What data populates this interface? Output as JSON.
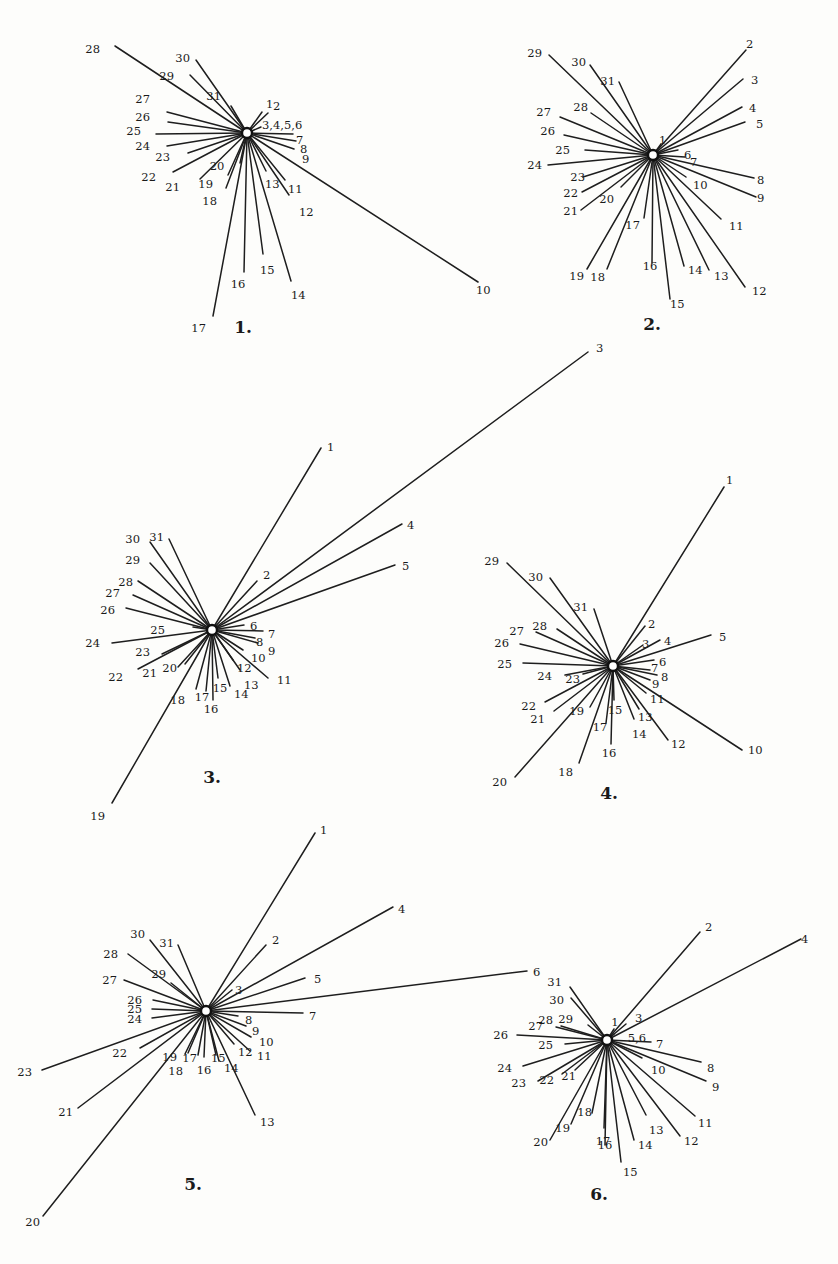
{
  "figure": {
    "panels": [
      {
        "caption": "1.",
        "rays": [
          "1",
          "2",
          "3,4,5,6",
          "7",
          "8",
          "9",
          "10",
          "11",
          "12",
          "13",
          "14",
          "15",
          "16",
          "17",
          "18",
          "19",
          "20",
          "21",
          "22",
          "23",
          "24",
          "25",
          "26",
          "27",
          "28",
          "29",
          "30",
          "31"
        ]
      },
      {
        "caption": "2.",
        "rays": [
          "1",
          "2",
          "3",
          "4",
          "5",
          "6",
          "7",
          "8",
          "9",
          "10",
          "11",
          "12",
          "13",
          "14",
          "15",
          "16",
          "17",
          "18",
          "19",
          "20",
          "21",
          "22",
          "23",
          "24",
          "25",
          "26",
          "27",
          "28",
          "29",
          "30",
          "31"
        ]
      },
      {
        "caption": "3.",
        "rays": [
          "1",
          "2",
          "3",
          "4",
          "5",
          "6",
          "7",
          "8",
          "9",
          "10",
          "11",
          "12",
          "13",
          "14",
          "15",
          "16",
          "17",
          "18",
          "19",
          "20",
          "21",
          "22",
          "23",
          "24",
          "25",
          "26",
          "27",
          "28",
          "29",
          "30",
          "31"
        ]
      },
      {
        "caption": "4.",
        "rays": [
          "1",
          "2",
          "3",
          "4",
          "5",
          "6",
          "7",
          "8",
          "9",
          "10",
          "11",
          "12",
          "13",
          "14",
          "15",
          "16",
          "17",
          "18",
          "19",
          "20",
          "21",
          "22",
          "23",
          "24",
          "25",
          "26",
          "27",
          "28",
          "29",
          "30",
          "31"
        ]
      },
      {
        "caption": "5.",
        "rays": [
          "1",
          "2",
          "3",
          "4",
          "5",
          "6",
          "7",
          "8",
          "9",
          "10",
          "11",
          "12",
          "13",
          "14",
          "15",
          "16",
          "17",
          "18",
          "19",
          "20",
          "21",
          "22",
          "23",
          "24",
          "25",
          "26",
          "27",
          "28",
          "29",
          "30",
          "31"
        ]
      },
      {
        "caption": "6.",
        "rays": [
          "1",
          "2",
          "3",
          "4",
          "5,6",
          "7",
          "8",
          "9",
          "10",
          "11",
          "12",
          "13",
          "14",
          "15",
          "16",
          "17",
          "18",
          "19",
          "20",
          "21",
          "22",
          "23",
          "24",
          "25",
          "26",
          "27",
          "28",
          "29",
          "30",
          "31"
        ]
      }
    ]
  }
}
